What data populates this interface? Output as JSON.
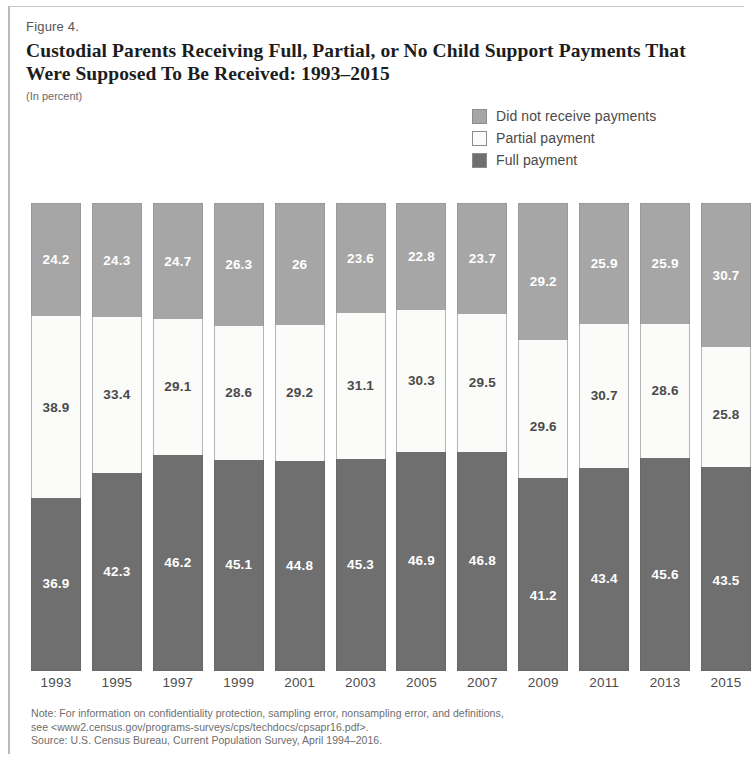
{
  "figure": {
    "number": "Figure 4.",
    "title": "Custodial Parents Receiving Full, Partial, or No Child Support Payments That Were Supposed To Be Received: 1993–2015",
    "subtitle": "(In percent)"
  },
  "legend": {
    "items": [
      {
        "label": "Did not receive payments",
        "color": "#a6a6a6",
        "key": "did_not_receive"
      },
      {
        "label": "Partial payment",
        "color": "#fbfbfa",
        "key": "partial"
      },
      {
        "label": "Full payment",
        "color": "#6f6f6f",
        "key": "full"
      }
    ]
  },
  "footnotes": {
    "line1": "Note: For information on confidentiality protection, sampling error, nonsampling error, and definitions,",
    "line2": "see <www2.census.gov/programs-surveys/cps/techdocs/cpsapr16.pdf>.",
    "line3": "Source: U.S. Census Bureau, Current Population Survey, April 1994–2016."
  },
  "chart_data": {
    "type": "bar",
    "subtype": "stacked-bar-100",
    "title": "Custodial Parents Receiving Full, Partial, or No Child Support Payments That Were Supposed To Be Received: 1993–2015",
    "subtitle": "(In percent)",
    "xlabel": "",
    "ylabel": "",
    "ylim": [
      0,
      100
    ],
    "grid": false,
    "legend_position": "top-right",
    "stack_order_top_to_bottom": [
      "Did not receive payments",
      "Partial payment",
      "Full payment"
    ],
    "categories": [
      "1993",
      "1995",
      "1997",
      "1999",
      "2001",
      "2003",
      "2005",
      "2007",
      "2009",
      "2011",
      "2013",
      "2015"
    ],
    "series": [
      {
        "name": "Did not receive payments",
        "color": "#a6a6a6",
        "values": [
          24.2,
          24.3,
          24.7,
          26.3,
          26.0,
          23.6,
          22.8,
          23.7,
          29.2,
          25.9,
          25.9,
          30.7
        ]
      },
      {
        "name": "Partial payment",
        "color": "#fbfbfa",
        "values": [
          38.9,
          33.4,
          29.1,
          28.6,
          29.2,
          31.1,
          30.3,
          29.5,
          29.6,
          30.7,
          28.6,
          25.8
        ]
      },
      {
        "name": "Full payment",
        "color": "#6f6f6f",
        "values": [
          36.9,
          42.3,
          46.2,
          45.1,
          44.8,
          45.3,
          46.9,
          46.8,
          41.2,
          43.4,
          45.6,
          43.5
        ]
      }
    ]
  }
}
